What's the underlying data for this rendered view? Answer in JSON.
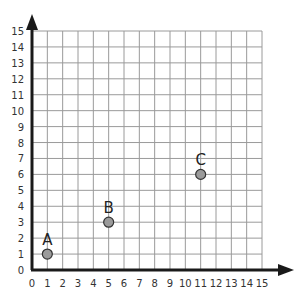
{
  "chart_data": {
    "type": "scatter",
    "title": "",
    "xlabel": "",
    "ylabel": "",
    "xlim": [
      0,
      15
    ],
    "ylim": [
      0,
      15
    ],
    "grid": true,
    "x_ticks": [
      "0",
      "1",
      "2",
      "3",
      "4",
      "5",
      "6",
      "7",
      "8",
      "9",
      "10",
      "11",
      "12",
      "13",
      "14",
      "15"
    ],
    "y_ticks": [
      "0",
      "1",
      "2",
      "3",
      "4",
      "5",
      "6",
      "7",
      "8",
      "9",
      "10",
      "11",
      "12",
      "13",
      "14",
      "15"
    ],
    "series": [
      {
        "name": "points",
        "points": [
          {
            "label": "A",
            "x": 1,
            "y": 1
          },
          {
            "label": "B",
            "x": 5,
            "y": 3
          },
          {
            "label": "C",
            "x": 11,
            "y": 6
          }
        ]
      }
    ],
    "legend": null
  },
  "colors": {
    "grid": "#9a9a9a",
    "axis": "#1a1a1a",
    "point_fill": "#9b9b9b",
    "point_stroke": "#333333"
  }
}
